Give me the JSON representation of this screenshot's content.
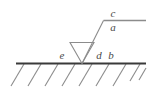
{
  "diagram": {
    "colors": {
      "ground_line": "#3a3a3a",
      "hatch": "#8c8c8c",
      "leader": "#8c8c8c",
      "reference_line": "#8c8c8c",
      "symbol": "#8c8c8c",
      "text": "#4a4a4a",
      "background": "#ffffff"
    },
    "labels": {
      "above_reference": "c",
      "below_reference": "a",
      "left_of_symbol": "e",
      "right_of_symbol_inner": "d",
      "right_of_symbol_outer": "b"
    },
    "elements": {
      "ground_line_name": "base-material-line",
      "hatch_name": "section-hatching",
      "symbol_name": "fillet-weld-triangle",
      "leader_name": "leader-line",
      "reference_name": "reference-line",
      "divider_name": "fraction-divider"
    },
    "hatch_count": 9
  }
}
